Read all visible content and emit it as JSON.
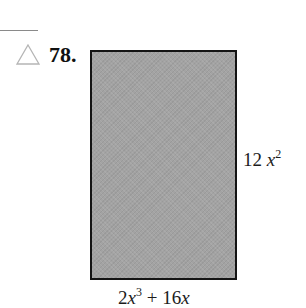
{
  "problem": {
    "number": "78.",
    "marker_icon": "triangle-outline-icon",
    "marker_color": "#b5b5b5"
  },
  "figure": {
    "shape": "rectangle",
    "fill_color": "#a3a3a3",
    "border_color": "#141414",
    "height_label": {
      "coefficient": "12",
      "variable": "x",
      "exponent": "2",
      "full_text": "12 x^2"
    },
    "width_label": {
      "term1_coefficient": "2",
      "term1_variable": "x",
      "term1_exponent": "3",
      "operator": "+",
      "term2_coefficient": "16",
      "term2_variable": "x",
      "full_text": "2x^3 + 16x"
    }
  }
}
